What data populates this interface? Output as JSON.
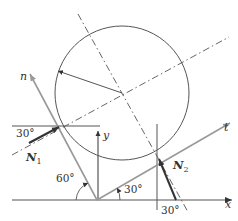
{
  "diagram": {
    "title": "",
    "colors": {
      "line": "#555555",
      "gray_axis": "#999999",
      "force": "#333333",
      "text": "#333333"
    },
    "labels": {
      "n_axis": "n",
      "t_axis": "t",
      "x_axis": "x",
      "y_axis": "y",
      "force1": "N",
      "force1_sub": "1",
      "force2": "N",
      "force2_sub": "2",
      "angle_n1": "30°",
      "angle_incline": "60°",
      "angle_t": "30°",
      "angle_n2": "30°"
    },
    "elements": [
      "circle (cylinder) resting between two inclined surfaces",
      "radius arrow from center to contact 1",
      "dash-dot normal lines through center",
      "coordinate axes x, y",
      "rotated axes n, t",
      "normal forces N1, N2"
    ]
  }
}
